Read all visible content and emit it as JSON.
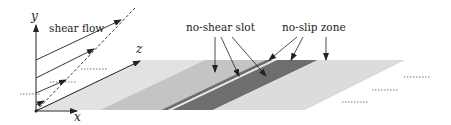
{
  "diagram": {
    "labels": {
      "y_axis": "y",
      "x_axis": "x",
      "z_axis": "z",
      "shear_flow": "shear flow",
      "no_shear_slot": "no-shear slot",
      "no_slip_zone": "no-slip zone"
    },
    "colors": {
      "light_region": "#e2e2e2",
      "medium_region": "#c4c4c4",
      "slot_band": "#6e6e6e",
      "gap_band": "#e6e6e6",
      "far_region": "#dcdcdc",
      "line": "#222222"
    }
  }
}
